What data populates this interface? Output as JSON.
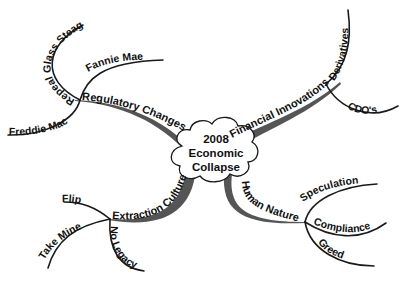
{
  "center": {
    "lines": [
      "2008",
      "Economic",
      "Collapse"
    ]
  },
  "branches": [
    {
      "label": "Regulatory Changes",
      "children": [
        "Fannie Mae",
        "Repeal Glass Steagal",
        "Freddie Mac"
      ]
    },
    {
      "label": "Financial Innovations",
      "children": [
        "Derivatives",
        "CDO's"
      ]
    },
    {
      "label": "Extraction Culture",
      "children": [
        "Flip",
        "Take Mine",
        "No Legacy"
      ]
    },
    {
      "label": "Human Nature",
      "children": [
        "Speculation",
        "Compliance",
        "Greed"
      ]
    }
  ],
  "colors": {
    "branch": "#555555",
    "line": "#1a1a1a",
    "text": "#111111",
    "background": "#ffffff"
  }
}
